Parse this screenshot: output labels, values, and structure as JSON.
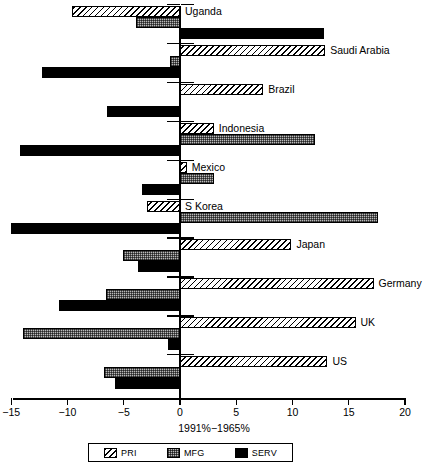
{
  "chart_data": {
    "type": "bar",
    "orientation": "horizontal",
    "title": "",
    "xlabel": "1991%−1965%",
    "ylabel": "",
    "xlim": [
      -15,
      20
    ],
    "xticks": [
      -15,
      -10,
      -5,
      0,
      5,
      10,
      15,
      20
    ],
    "xticklabels": [
      "−15",
      "−10",
      "−5",
      "0",
      "5",
      "10",
      "15",
      "20"
    ],
    "grid": false,
    "legend_position": "bottom",
    "categories": [
      "Uganda",
      "Saudi Arabia",
      "Brazil",
      "Indonesia",
      "Mexico",
      "S Korea",
      "Japan",
      "Germany",
      "UK",
      "US"
    ],
    "series": [
      {
        "name": "PRI",
        "values": [
          -9.6,
          12.9,
          7.4,
          3.0,
          0.6,
          -2.9,
          9.9,
          17.2,
          15.6,
          13.1
        ]
      },
      {
        "name": "MFG",
        "values": [
          -3.9,
          -0.9,
          0.0,
          12.0,
          3.0,
          17.6,
          -5.1,
          -6.6,
          -14.0,
          -6.8
        ]
      },
      {
        "name": "SERV",
        "values": [
          12.8,
          -12.3,
          -6.5,
          -14.2,
          -3.4,
          -15.0,
          -3.7,
          -10.8,
          -1.1,
          -5.8
        ]
      }
    ]
  },
  "legend": {
    "items": [
      {
        "label": "PRI",
        "pattern": "diagonal-hatch"
      },
      {
        "label": "MFG",
        "pattern": "checkered"
      },
      {
        "label": "SERV",
        "pattern": "solid-black"
      }
    ]
  },
  "colors": {
    "foreground": "#000000",
    "background": "#ffffff",
    "mfg_fill": "#b9b9b9"
  }
}
